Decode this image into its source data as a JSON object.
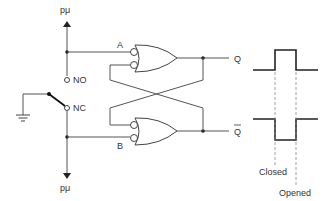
{
  "diagram": {
    "type": "switch-debounce-circuit",
    "labels": {
      "supply_top": "pμ",
      "supply_bottom": "pμ",
      "input_a": "A",
      "input_b": "B",
      "normally_open": "NO",
      "normally_closed": "NC",
      "output_q": "Q",
      "output_q_bar": "Q",
      "closed": "Closed",
      "opened": "Opened"
    },
    "components": [
      {
        "id": "switch",
        "kind": "spdt-switch",
        "contacts": [
          "NO",
          "NC"
        ],
        "common": "ground"
      },
      {
        "id": "gate-1",
        "kind": "negative-input-or",
        "inputs": [
          "A",
          "Q̄"
        ],
        "output": "Q"
      },
      {
        "id": "gate-2",
        "kind": "negative-input-or",
        "inputs": [
          "Q",
          "B"
        ],
        "output": "Q̄"
      },
      {
        "id": "ground",
        "kind": "ground-symbol"
      }
    ],
    "waveforms": [
      {
        "signal": "Q",
        "shape": "positive-pulse"
      },
      {
        "signal": "Q̄",
        "shape": "negative-pulse"
      }
    ],
    "colors": {
      "line": "#555555",
      "waveform": "#222222",
      "text": "#333333",
      "background": "#ffffff"
    }
  }
}
